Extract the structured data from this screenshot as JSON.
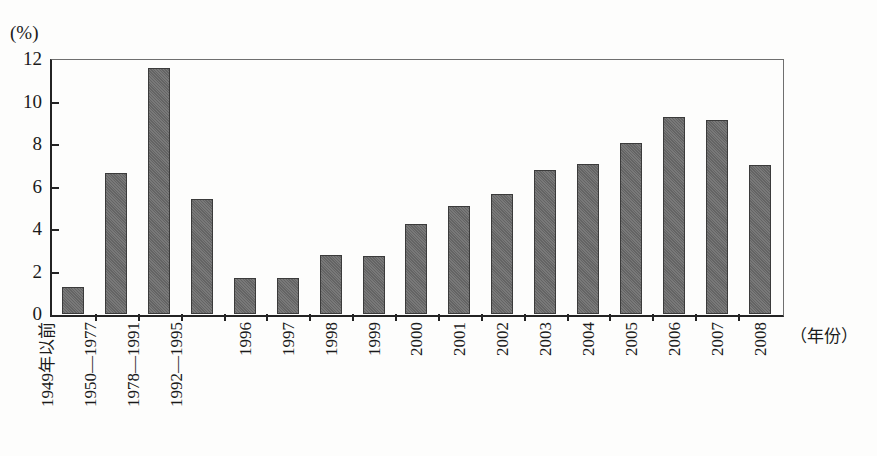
{
  "chart_data": {
    "type": "bar",
    "title": "",
    "subtitle": "",
    "xlabel": "（年份）",
    "ylabel": "(%)",
    "ylim": [
      0,
      12
    ],
    "yticks": [
      0,
      2,
      4,
      6,
      8,
      10,
      12
    ],
    "grid": false,
    "legend": null,
    "bar_color": "#6a6a6a",
    "bar_edge_color": "#3b3b3b",
    "axis_color": "#232323",
    "categories": [
      "1949年以前",
      "1950—1977",
      "1978—1991",
      "1992—1995",
      "1996",
      "1997",
      "1998",
      "1999",
      "2000",
      "2001",
      "2002",
      "2003",
      "2004",
      "2005",
      "2006",
      "2007",
      "2008"
    ],
    "values": [
      1.25,
      6.65,
      11.6,
      5.4,
      1.7,
      1.7,
      2.8,
      2.75,
      4.25,
      5.1,
      5.65,
      6.8,
      7.05,
      8.05,
      9.25,
      9.15,
      7.0
    ]
  },
  "axis": {
    "y_unit_label": "(%)",
    "x_unit_label": "（年份）"
  }
}
